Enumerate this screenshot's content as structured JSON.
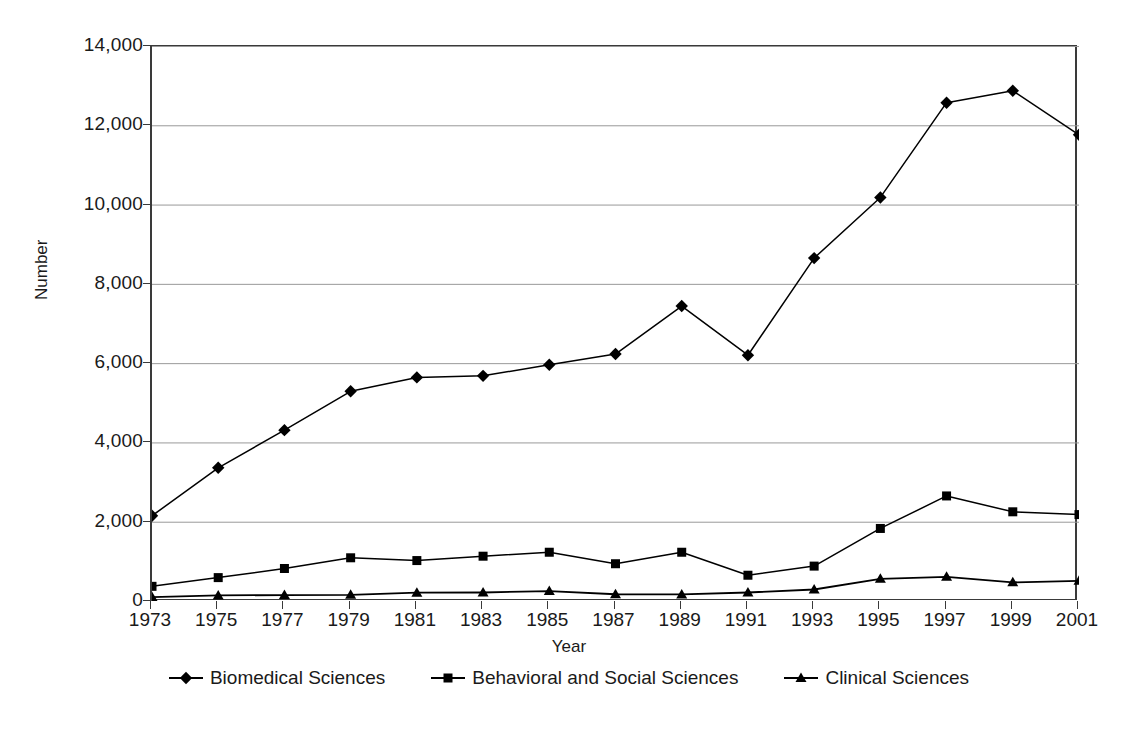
{
  "chart_data": {
    "type": "line",
    "title": "",
    "subtitle": "",
    "xlabel": "Year",
    "ylabel": "Number",
    "x": [
      1973,
      1975,
      1977,
      1979,
      1981,
      1983,
      1985,
      1987,
      1989,
      1991,
      1993,
      1995,
      1997,
      1999,
      2001
    ],
    "categories": [
      "1973",
      "1975",
      "1977",
      "1979",
      "1981",
      "1983",
      "1985",
      "1987",
      "1989",
      "1991",
      "1993",
      "1995",
      "1997",
      "1999",
      "2001"
    ],
    "xlim": [
      1973,
      2001
    ],
    "ylim": [
      0,
      14000
    ],
    "y_ticks": [
      0,
      2000,
      4000,
      6000,
      8000,
      10000,
      12000,
      14000
    ],
    "y_tick_labels": [
      "0",
      "2,000",
      "4,000",
      "6,000",
      "8,000",
      "10,000",
      "12,000",
      "14,000"
    ],
    "grid": "horizontal",
    "legend_position": "bottom",
    "series": [
      {
        "name": "Biomedical Sciences",
        "marker": "diamond",
        "color": "#000000",
        "values": [
          2150,
          3360,
          4310,
          5290,
          5640,
          5680,
          5960,
          6230,
          7440,
          6200,
          8650,
          10180,
          12570,
          12870,
          11760
        ]
      },
      {
        "name": "Behavioral and Social Sciences",
        "marker": "square",
        "color": "#000000",
        "values": [
          370,
          590,
          820,
          1090,
          1020,
          1130,
          1230,
          940,
          1230,
          650,
          880,
          1830,
          2650,
          2250,
          2180
        ]
      },
      {
        "name": "Clinical Sciences",
        "marker": "triangle",
        "color": "#000000",
        "values": [
          100,
          140,
          150,
          155,
          210,
          215,
          250,
          170,
          165,
          215,
          290,
          560,
          610,
          470,
          510
        ]
      }
    ]
  },
  "axes": {
    "y_title": "Number",
    "x_title": "Year"
  },
  "legend": {
    "items": [
      {
        "label": "Biomedical Sciences",
        "marker": "diamond-marker-icon"
      },
      {
        "label": "Behavioral and Social Sciences",
        "marker": "square-marker-icon"
      },
      {
        "label": "Clinical Sciences",
        "marker": "triangle-marker-icon"
      }
    ]
  },
  "colors": {
    "axis": "#3a3a3a",
    "grid": "#999999",
    "series": "#000000",
    "background": "#ffffff"
  }
}
